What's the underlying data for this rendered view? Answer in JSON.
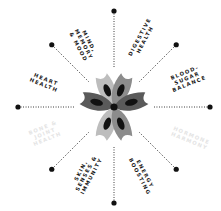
{
  "diagram": {
    "title": "",
    "center": {
      "x": 114,
      "y": 107
    },
    "colors": {
      "ink": "#111111",
      "petal_light": "#bdbdbd",
      "petal_mid": "#8c8c8c",
      "petal_dark": "#5a5a5a",
      "faded_text": "#e4e4e4"
    },
    "rays": [
      {
        "angle_deg": -90,
        "name": "north"
      },
      {
        "angle_deg": -45,
        "name": "north-east"
      },
      {
        "angle_deg": 0,
        "name": "east"
      },
      {
        "angle_deg": 45,
        "name": "south-east"
      },
      {
        "angle_deg": 90,
        "name": "south"
      },
      {
        "angle_deg": 135,
        "name": "south-west"
      },
      {
        "angle_deg": 180,
        "name": "west"
      },
      {
        "angle_deg": 225,
        "name": "north-west"
      }
    ],
    "labels": [
      {
        "id": "mind",
        "text": "MIND,\nMEMORY\n& MOOD",
        "x": 84,
        "y": 44,
        "rotate": 62,
        "faded": false
      },
      {
        "id": "digestive",
        "text": "DIGESTIVE\nHEALTH",
        "x": 142,
        "y": 38,
        "rotate": -62,
        "faded": false
      },
      {
        "id": "blood-sugar",
        "text": "BLOOD-\nSUGAR\nBALANCE",
        "x": 187,
        "y": 78,
        "rotate": -22,
        "faded": false
      },
      {
        "id": "heart",
        "text": "HEART\nHEALTH",
        "x": 45,
        "y": 82,
        "rotate": 22,
        "faded": false
      },
      {
        "id": "bone",
        "text": "BONE &\nJOINT\nHEALTH",
        "x": 45,
        "y": 133,
        "rotate": -22,
        "faded": true
      },
      {
        "id": "skin",
        "text": "SKIN,\nSENSES &\nIMMUNITY",
        "x": 86,
        "y": 173,
        "rotate": -62,
        "faded": false
      },
      {
        "id": "energy",
        "text": "ENERGY\nBOOSTING",
        "x": 142,
        "y": 175,
        "rotate": 62,
        "faded": false
      },
      {
        "id": "hormone",
        "text": "HORMONE\nHARMONY",
        "x": 190,
        "y": 138,
        "rotate": 22,
        "faded": true
      }
    ]
  }
}
